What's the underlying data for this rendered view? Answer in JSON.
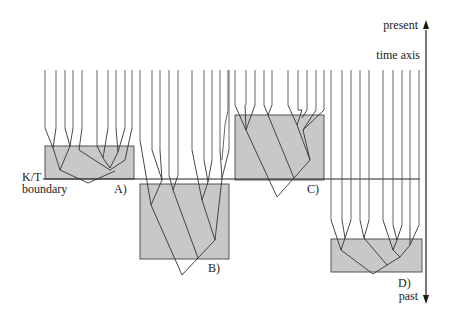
{
  "axis": {
    "present_label": "present",
    "title": "time axis",
    "past_label": "past",
    "color": "#1a1a1a"
  },
  "boundary": {
    "label_line1": "K/T",
    "label_line2": "boundary"
  },
  "panels": [
    {
      "id": "A",
      "label": "A)",
      "box_fill": "#c8c8c8"
    },
    {
      "id": "B",
      "label": "B)",
      "box_fill": "#c8c8c8"
    },
    {
      "id": "C",
      "label": "C)",
      "box_fill": "#c8c8c8"
    },
    {
      "id": "D",
      "label": "D)",
      "box_fill": "#c8c8c8"
    }
  ]
}
